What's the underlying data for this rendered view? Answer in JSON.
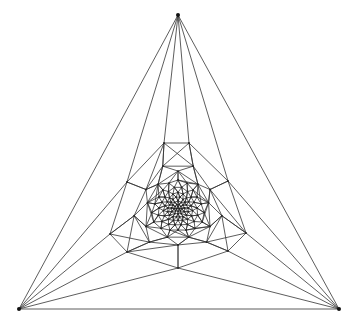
{
  "diagram": {
    "type": "planar-triangulated-mesh",
    "canvas": {
      "width": 354,
      "height": 325
    },
    "colors": {
      "edge": "#333333",
      "node": "#222222",
      "background": "#ffffff"
    },
    "corners": [
      {
        "id": "top",
        "x": 178,
        "y": 15
      },
      {
        "id": "bottom-left",
        "x": 19,
        "y": 309
      },
      {
        "id": "bottom-right",
        "x": 339,
        "y": 309
      }
    ],
    "outer_ring": [
      {
        "id": "r0",
        "x": 164,
        "y": 143
      },
      {
        "id": "r1",
        "x": 189,
        "y": 143
      },
      {
        "id": "r2",
        "x": 228,
        "y": 181
      },
      {
        "id": "r3",
        "x": 246,
        "y": 233
      },
      {
        "id": "r4",
        "x": 228,
        "y": 251
      },
      {
        "id": "r5",
        "x": 178,
        "y": 268
      },
      {
        "id": "r6",
        "x": 127,
        "y": 252
      },
      {
        "id": "r7",
        "x": 110,
        "y": 234
      },
      {
        "id": "r8",
        "x": 127,
        "y": 182
      }
    ],
    "corner_fans": {
      "top": [
        "r8",
        "r0",
        "r1",
        "r2"
      ],
      "bottom-left": [
        "r8",
        "r7",
        "r6",
        "r5"
      ],
      "bottom-right": [
        "r2",
        "r3",
        "r4",
        "r5"
      ]
    },
    "inner_center": {
      "x": 178,
      "y": 208
    },
    "inner_rings": [
      {
        "count": 9,
        "radius": 42,
        "rotation": -70
      },
      {
        "count": 9,
        "radius": 33,
        "rotation": -50
      },
      {
        "count": 18,
        "radius": 25,
        "rotation": -90
      },
      {
        "count": 18,
        "radius": 19,
        "rotation": -80
      },
      {
        "count": 18,
        "radius": 14,
        "rotation": -90
      },
      {
        "count": 18,
        "radius": 10,
        "rotation": -80
      },
      {
        "count": 12,
        "radius": 6.5,
        "rotation": -90
      },
      {
        "count": 9,
        "radius": 3.5,
        "rotation": -70
      },
      {
        "count": 3,
        "radius": 1.2,
        "rotation": -90
      }
    ]
  }
}
